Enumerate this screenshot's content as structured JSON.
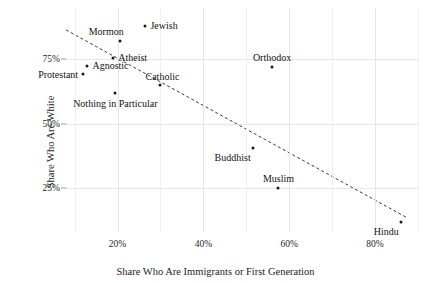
{
  "chart_data": {
    "type": "scatter",
    "title": "",
    "xlabel": "Share Who Are Immigrants or First Generation",
    "ylabel": "Share Who Are White",
    "xlim": [
      8,
      90
    ],
    "ylim": [
      8,
      95
    ],
    "xticks": [
      20,
      40,
      60,
      80
    ],
    "xticklabels": [
      "20%",
      "40%",
      "60%",
      "80%"
    ],
    "yticks": [
      25,
      50,
      75
    ],
    "yticklabels": [
      "25%",
      "50%",
      "75%"
    ],
    "grid": true,
    "legend": "none",
    "points": [
      {
        "label": "Jewish",
        "x": 26.5,
        "y": 88.0,
        "label_pos": "right"
      },
      {
        "label": "Mormon",
        "x": 20.5,
        "y": 82.0,
        "label_pos": "up-left"
      },
      {
        "label": "Atheist",
        "x": 19.0,
        "y": 75.5,
        "label_pos": "right"
      },
      {
        "label": "Agnostic",
        "x": 13.0,
        "y": 72.5,
        "label_pos": "right"
      },
      {
        "label": "Protestant",
        "x": 12.0,
        "y": 69.5,
        "label_pos": "left"
      },
      {
        "label": "Catholic",
        "x": 30.0,
        "y": 65.0,
        "label_pos": "up-right"
      },
      {
        "label": "Nothing in Particular",
        "x": 19.5,
        "y": 62.0,
        "label_pos": "down-center"
      },
      {
        "label": "Orthodox",
        "x": 56.0,
        "y": 72.0,
        "label_pos": "up-center"
      },
      {
        "label": "Buddhist",
        "x": 51.5,
        "y": 40.5,
        "label_pos": "down-left"
      },
      {
        "label": "Muslim",
        "x": 57.5,
        "y": 25.0,
        "label_pos": "up-center"
      },
      {
        "label": "Hindu",
        "x": 86.0,
        "y": 12.0,
        "label_pos": "down-left"
      }
    ],
    "trendline": {
      "style": "dashed",
      "x_start": 8.0,
      "y_start": 86.5,
      "x_end": 87.5,
      "y_end": 13.5
    }
  }
}
